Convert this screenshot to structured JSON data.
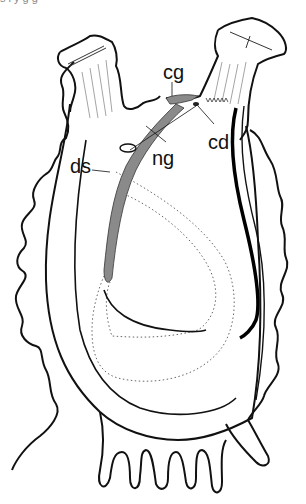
{
  "figure": {
    "labels": [
      {
        "id": "cg",
        "text": "cg",
        "x": 163,
        "y": 62
      },
      {
        "id": "cd",
        "text": "cd",
        "x": 208,
        "y": 134
      },
      {
        "id": "ng",
        "text": "ng",
        "x": 152,
        "y": 149
      },
      {
        "id": "ds",
        "text": "ds",
        "x": 70,
        "y": 155
      }
    ],
    "colors": {
      "outline": "#111111",
      "gland_fill": "#8a8a8a",
      "stipple": "#666666",
      "background": "#ffffff"
    },
    "top_clipped_text": "s    i   y          g     g"
  }
}
